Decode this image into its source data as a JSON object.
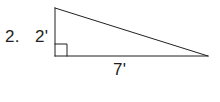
{
  "figure": {
    "kind": "right-triangle-diagram",
    "problem_number": "2.",
    "labels": {
      "vertical_leg": "2'",
      "base": "7'",
      "hypotenuse": ""
    },
    "measurements": {
      "vertical_leg_value": 2,
      "base_value": 7,
      "unit": "feet",
      "unit_symbol": "'"
    },
    "right_angle": {
      "present": true,
      "vertex": "bottom-left",
      "marker": "square"
    },
    "colors": {
      "stroke": "#231f20",
      "text": "#231f20",
      "background": "#ffffff"
    },
    "geometry": {
      "apex": {
        "x": 55,
        "y": 8
      },
      "right_angle_vertex": {
        "x": 55,
        "y": 56
      },
      "far_vertex": {
        "x": 208,
        "y": 56
      },
      "right_angle_marker_size": 12,
      "stroke_width": 1
    }
  }
}
